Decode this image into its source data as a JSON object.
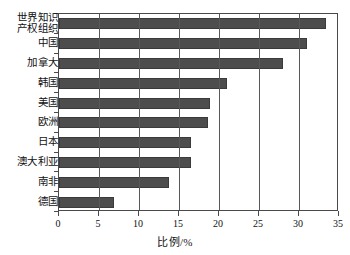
{
  "chart_data": {
    "type": "bar",
    "orientation": "horizontal",
    "title": "",
    "xlabel": "比例/%",
    "ylabel": "",
    "xlim": [
      0,
      35
    ],
    "xticks": [
      "0",
      "5",
      "10",
      "15",
      "20",
      "25",
      "30",
      "35"
    ],
    "grid": true,
    "legend": "none",
    "bar_color": "#4d4d4d",
    "categories": [
      "世界知识\n产权组织",
      "中国",
      "加拿大",
      "韩国",
      "美国",
      "欧洲",
      "日本",
      "澳大利亚",
      "南非",
      "德国"
    ],
    "values": [
      33.4,
      31.0,
      28.0,
      21.0,
      18.9,
      18.6,
      16.5,
      16.5,
      13.8,
      6.9
    ]
  }
}
